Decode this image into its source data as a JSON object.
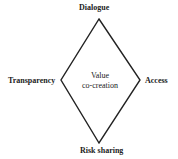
{
  "diagram": {
    "center_label": [
      "Value",
      "co-creation"
    ],
    "vertices": {
      "top": "Dialogue",
      "left": "Transparency",
      "right": "Access",
      "bottom": "Risk sharing"
    },
    "shape": "diamond",
    "stroke_color": "#222222"
  }
}
